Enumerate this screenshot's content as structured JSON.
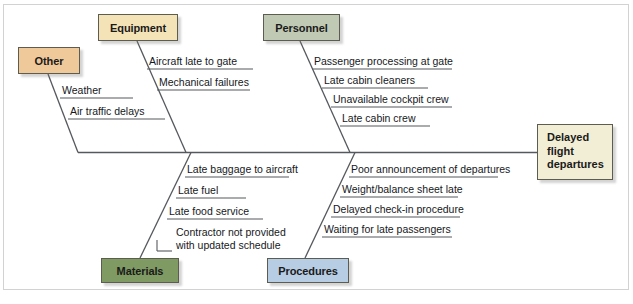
{
  "diagram": {
    "type": "fishbone-ishikawa",
    "effect": {
      "label": "Delayed flight departures",
      "line1": "Delayed",
      "line2": "flight",
      "line3": "departures",
      "color": "#f2eed5"
    },
    "categories": [
      {
        "id": "other",
        "label": "Other",
        "color": "#f0c99a",
        "position": "top",
        "causes": [
          {
            "text": "Weather"
          },
          {
            "text": "Air traffic delays"
          }
        ]
      },
      {
        "id": "equipment",
        "label": "Equipment",
        "color": "#f5e3b8",
        "position": "top",
        "causes": [
          {
            "text": "Aircraft late to gate"
          },
          {
            "text": "Mechanical failures"
          }
        ]
      },
      {
        "id": "personnel",
        "label": "Personnel",
        "color": "#bfc9b4",
        "position": "top",
        "causes": [
          {
            "text": "Passenger processing at gate"
          },
          {
            "text": "Late cabin cleaners"
          },
          {
            "text": "Unavailable cockpit crew"
          },
          {
            "text": "Late cabin crew"
          }
        ]
      },
      {
        "id": "materials",
        "label": "Materials",
        "color": "#7f9b63",
        "position": "bottom",
        "causes": [
          {
            "text": "Late baggage to aircraft"
          },
          {
            "text": "Late fuel"
          },
          {
            "text": "Late food service"
          },
          {
            "text": "Contractor not provided",
            "text2": "with updated schedule"
          }
        ]
      },
      {
        "id": "procedures",
        "label": "Procedures",
        "color": "#b6cde4",
        "position": "bottom",
        "causes": [
          {
            "text": "Poor announcement of departures"
          },
          {
            "text": "Weight/balance sheet late"
          },
          {
            "text": "Delayed check-in procedure"
          },
          {
            "text": "Waiting for late passengers"
          }
        ]
      }
    ],
    "line_color": "#55585c"
  }
}
